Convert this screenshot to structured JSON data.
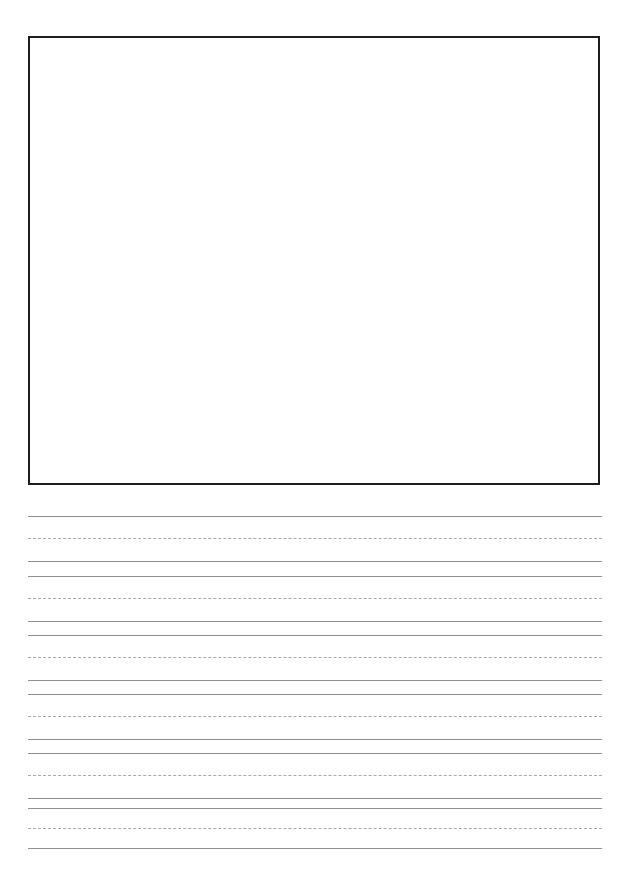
{
  "page": {
    "width": 638,
    "height": 880,
    "background_color": "#ffffff",
    "orientation": "portrait"
  },
  "drawing_box": {
    "name": "Drawing / illustration box",
    "label": "",
    "border_color": "#1d1d1d",
    "border_width_px": 2,
    "fill_color": "#ffffff",
    "x": 28,
    "y": 36,
    "width": 572,
    "height": 449,
    "content": ""
  },
  "writing_area": {
    "name": "Handwriting practice lines",
    "left": 28,
    "right": 602,
    "line_color_solid": "#8f8f8f",
    "line_color_dashed": "#a8a8a8",
    "group_count": 6,
    "lines_per_group": 3,
    "group_period_px": 59,
    "first_group_top_y": 516,
    "groups": [
      {
        "index": 1,
        "top_y": 516,
        "mid_y": 538,
        "base_y": 561,
        "top_style": "solid",
        "mid_style": "dashed",
        "base_style": "solid",
        "text": ""
      },
      {
        "index": 2,
        "top_y": 576,
        "mid_y": 598,
        "base_y": 621,
        "top_style": "solid",
        "mid_style": "dashed",
        "base_style": "solid",
        "text": ""
      },
      {
        "index": 3,
        "top_y": 635,
        "mid_y": 657,
        "base_y": 680,
        "top_style": "solid",
        "mid_style": "dashed",
        "base_style": "solid",
        "text": ""
      },
      {
        "index": 4,
        "top_y": 694,
        "mid_y": 716,
        "base_y": 739,
        "top_style": "solid",
        "mid_style": "dashed",
        "base_style": "solid",
        "text": ""
      },
      {
        "index": 5,
        "top_y": 753,
        "mid_y": 775,
        "base_y": 798,
        "top_style": "solid",
        "mid_style": "dashed",
        "base_style": "solid",
        "text": ""
      },
      {
        "index": 6,
        "top_y": 808,
        "mid_y": 828,
        "base_y": 848,
        "top_style": "solid",
        "mid_style": "dashed",
        "base_style": "solid",
        "text": ""
      }
    ]
  }
}
